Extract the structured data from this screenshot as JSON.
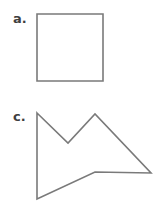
{
  "page": {
    "background_color": "#ffffff",
    "width": 161,
    "height": 207
  },
  "style": {
    "stroke_color": "#7a7a7a",
    "stroke_width": 1.6,
    "fill_color": "none",
    "label_color": "#3f3f3f"
  },
  "figures": [
    {
      "id": "a",
      "label": "a.",
      "shape_name": "square",
      "shape_type": "polygon",
      "vertex_count": 4,
      "points": "37,14 103,14 103,81 37,81",
      "bounds": {
        "x": 37,
        "y": 14,
        "width": 66,
        "height": 67
      }
    },
    {
      "id": "c",
      "label": "c.",
      "shape_name": "concave-arrow-polygon",
      "shape_type": "polygon",
      "vertex_count": 6,
      "points": "37,113 68,143 95,114 151,173 95,172 37,199",
      "bounds": {
        "x": 37,
        "y": 113,
        "width": 114,
        "height": 86
      }
    }
  ]
}
